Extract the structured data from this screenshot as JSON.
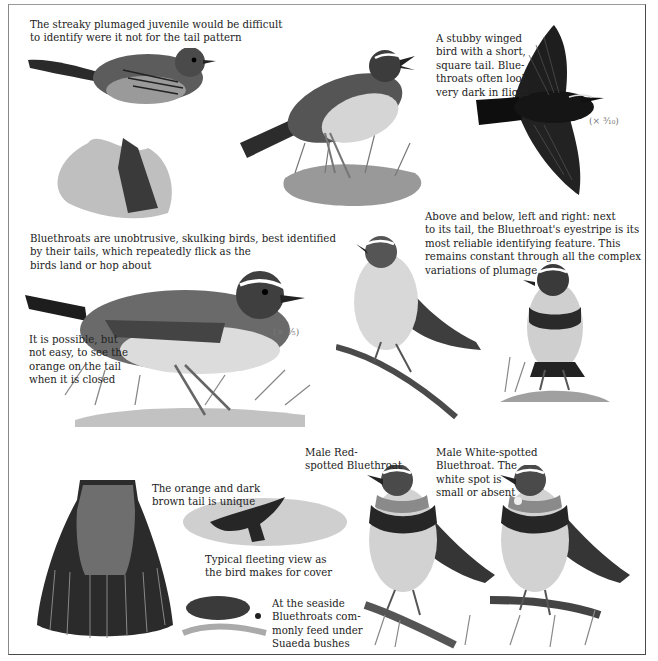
{
  "page": {
    "captions": {
      "juvenile": "The streaky plumaged juvenile would be difficult\nto identify were it not for the tail pattern",
      "flight": "A stubby winged\nbird with a short,\nsquare tail. Blue-\nthroats often look\nvery dark in flight",
      "skulking": "Bluethroats are unobtrusive, skulking birds, best identified\nby their tails, which repeatedly flick as the\nbirds land or hop about",
      "eyestripe": "Above and below, left and right: next\nto its tail, the Bluethroat's eyestripe is its\nmost reliable identifying feature. This\nremains constant through all the complex\nvariations of plumage",
      "closed_tail": "It is possible, but\nnot easy, to see the\norange on the tail\nwhen it is closed",
      "red_spotted": "Male Red-\nspotted Bluethroat",
      "white_spotted": "Male White-spotted\nBluethroat. The\nwhite spot is\nsmall or absent",
      "tail_unique": "The orange and dark\nbrown tail is unique",
      "fleeting": "Typical fleeting view as\nthe bird makes for cover",
      "seaside": "At the seaside\nBluethroats com-\nmonly feed under\nSuaeda bushes"
    },
    "scales": {
      "flight": "(× ³⁄₁₀)",
      "main": "(× ³⁄₅)"
    },
    "illustrations": [
      "juvenile-bird-on-stump",
      "adult-bird-on-grass-tuft",
      "bird-in-flight",
      "large-bird-in-grass",
      "bird-on-branch-left",
      "bird-on-mossy-ground-right",
      "spread-tail-fan",
      "fleeing-bird-over-bush",
      "suaeda-bush-seaside",
      "male-red-spotted-bluethroat",
      "male-white-spotted-bluethroat"
    ],
    "colors": {
      "ink": "#1c1c1c",
      "frame": "#4a4a4a",
      "paper": "#ffffff"
    }
  }
}
